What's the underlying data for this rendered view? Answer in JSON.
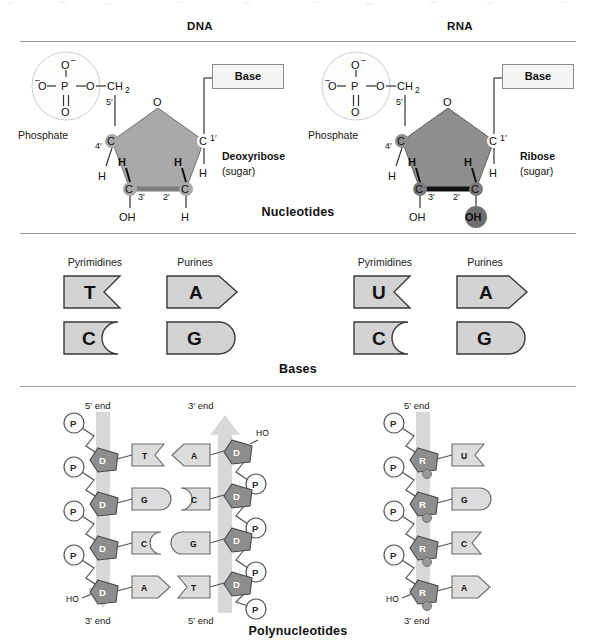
{
  "columns": {
    "dna": "DNA",
    "rna": "RNA"
  },
  "sections": {
    "nucleotides": "Nucleotides",
    "bases": "Bases",
    "polynucleotides": "Polynucleotides"
  },
  "nucleotide": {
    "phosphate_label": "Phosphate",
    "base_label": "Base",
    "phosphate_atoms": {
      "top_o": "O",
      "top_charge": "–",
      "left_charge": "–",
      "left_o": "O",
      "p": "P",
      "right_o": "O",
      "bottom_o": "O"
    },
    "ch2": "CH",
    "ch2_sub": "2",
    "ring_o": "O",
    "carbon": "C",
    "hydrogen": "H",
    "hydroxyl": "OH",
    "primes": {
      "c1": "1′",
      "c2": "2′",
      "c3": "3′",
      "c4": "4′",
      "c5": "5′"
    },
    "dna": {
      "sugar_name": "Deoxyribose",
      "sugar_sub": "(sugar)",
      "c2_substituent": "H",
      "ring_fill": "#a9a9a9",
      "ring_bottom_edge": "#7e7e7e"
    },
    "rna": {
      "sugar_name": "Ribose",
      "sugar_sub": "(sugar)",
      "c2_substituent": "OH",
      "ring_fill": "#8e8e8e",
      "ring_bottom_edge": "#111111",
      "highlight_fill": "#6f6f6f"
    }
  },
  "bases": {
    "group_headers": {
      "pyrimidines": "Pyrimidines",
      "purines": "Purines"
    },
    "dna": {
      "pyrimidines": [
        {
          "letter": "T",
          "shape": "notch"
        },
        {
          "letter": "C",
          "shape": "concave"
        }
      ],
      "purines": [
        {
          "letter": "A",
          "shape": "point"
        },
        {
          "letter": "G",
          "shape": "round"
        }
      ]
    },
    "rna": {
      "pyrimidines": [
        {
          "letter": "U",
          "shape": "notch"
        },
        {
          "letter": "C",
          "shape": "concave"
        }
      ],
      "purines": [
        {
          "letter": "A",
          "shape": "point"
        },
        {
          "letter": "G",
          "shape": "round"
        }
      ]
    },
    "shape_fill": "#d3d3d3"
  },
  "polynucleotides": {
    "end_5": "5′ end",
    "end_3": "3′ end",
    "phosphate_symbol": "P",
    "deoxyribose_symbol": "D",
    "ribose_symbol": "R",
    "hydroxyl": "HO",
    "dna": {
      "left_strand": {
        "top_end": "5′ end",
        "bottom_end": "3′ end",
        "direction": "down",
        "bases": [
          "T",
          "G",
          "C",
          "A"
        ],
        "base_shapes": [
          "notch",
          "round",
          "concave",
          "point"
        ]
      },
      "right_strand": {
        "top_end": "3′ end",
        "bottom_end": "5′ end",
        "direction": "up",
        "bases": [
          "A",
          "C",
          "G",
          "T"
        ],
        "base_shapes": [
          "point",
          "concave",
          "round",
          "notch"
        ]
      }
    },
    "rna": {
      "strand": {
        "top_end": "5′ end",
        "bottom_end": "3′ end",
        "direction": "down",
        "bases": [
          "U",
          "G",
          "C",
          "A"
        ],
        "base_shapes": [
          "notch",
          "round",
          "concave",
          "point"
        ]
      }
    },
    "colors": {
      "backbone_arrow": "#d8d8d8",
      "sugar_fill": "#8d8d8d",
      "phosphate_fill": "#fbfbfb",
      "base_fill": "#dcdcdc"
    }
  }
}
